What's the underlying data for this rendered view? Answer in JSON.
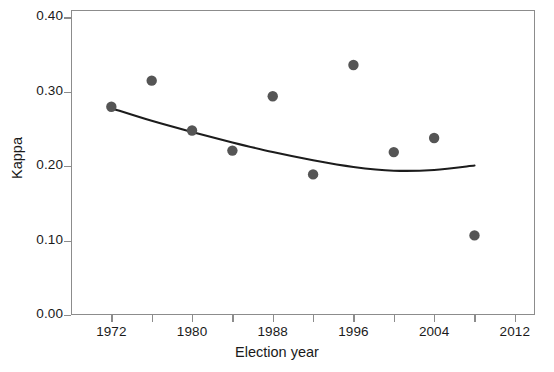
{
  "chart_data": {
    "type": "scatter",
    "title": "",
    "xlabel": "Election year",
    "ylabel": "Kappa",
    "xlim": [
      1968,
      2014
    ],
    "ylim": [
      0.0,
      0.41
    ],
    "grid": false,
    "legend": null,
    "x_tick_labels": [
      "1972",
      "1980",
      "1988",
      "1996",
      "2004",
      "2012"
    ],
    "x_tick_values": [
      1972,
      1980,
      1988,
      1996,
      2004,
      2012
    ],
    "x_minor_tick_values": [
      1976,
      1984,
      1992,
      2000,
      2008
    ],
    "y_tick_labels": [
      "0.00",
      "0.10",
      "0.20",
      "0.30",
      "0.40"
    ],
    "y_tick_values": [
      0.0,
      0.1,
      0.2,
      0.3,
      0.4
    ],
    "marker_color": "#555555",
    "line_color": "#1c1c1c",
    "axis_color": "#8c8c8c",
    "series": [
      {
        "name": "Kappa by election year",
        "kind": "points",
        "x": [
          1972,
          1976,
          1980,
          1984,
          1988,
          1992,
          1996,
          2000,
          2004,
          2008
        ],
        "values": [
          0.28,
          0.315,
          0.248,
          0.221,
          0.294,
          0.189,
          0.336,
          0.219,
          0.238,
          0.107
        ]
      },
      {
        "name": "Fitted quadratic trend",
        "kind": "line",
        "x": [
          1972,
          1976,
          1980,
          1984,
          1988,
          1992,
          1996,
          2000,
          2004,
          2008
        ],
        "values": [
          0.278,
          0.261,
          0.246,
          0.232,
          0.219,
          0.208,
          0.199,
          0.194,
          0.195,
          0.201
        ]
      }
    ]
  }
}
